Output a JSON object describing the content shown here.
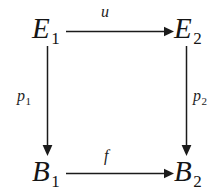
{
  "diagram": {
    "type": "commutative-square",
    "background_color": "#ffffff",
    "ink_color": "#1b1b1b",
    "nodes": [
      {
        "id": "e1",
        "base": "E",
        "subscript": "1",
        "position": "top-left"
      },
      {
        "id": "e2",
        "base": "E",
        "subscript": "2",
        "position": "top-right"
      },
      {
        "id": "b1",
        "base": "B",
        "subscript": "1",
        "position": "bottom-left"
      },
      {
        "id": "b2",
        "base": "B",
        "subscript": "2",
        "position": "bottom-right"
      }
    ],
    "edges": [
      {
        "id": "u",
        "base": "u",
        "subscript": "",
        "from": "e1",
        "to": "e2",
        "direction": "right",
        "label_position": "above"
      },
      {
        "id": "f",
        "base": "f",
        "subscript": "",
        "from": "b1",
        "to": "b2",
        "direction": "right",
        "label_position": "above"
      },
      {
        "id": "p1",
        "base": "p",
        "subscript": "1",
        "from": "e1",
        "to": "b1",
        "direction": "down",
        "label_position": "left"
      },
      {
        "id": "p2",
        "base": "p",
        "subscript": "2",
        "from": "e2",
        "to": "b2",
        "direction": "down",
        "label_position": "right"
      }
    ]
  }
}
